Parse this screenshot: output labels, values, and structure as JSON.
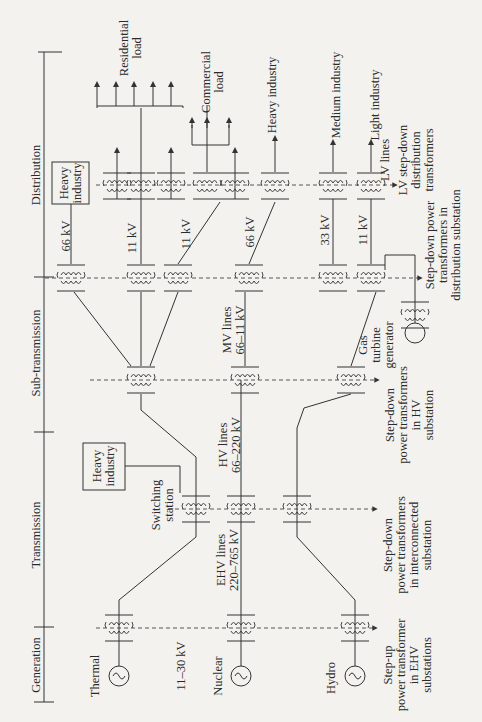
{
  "stages": [
    "Generation",
    "Transmission",
    "Sub-transmission",
    "Distribution"
  ],
  "generators": [
    {
      "name": "Thermal"
    },
    {
      "name": "Nuclear"
    },
    {
      "name": "Hydro"
    },
    {
      "name": "Gas turbine generator",
      "lines": [
        "Gas",
        "turbine",
        "generator"
      ]
    }
  ],
  "voltage_labels": {
    "generation": "11–30 kV",
    "ehv": [
      "EHV lines",
      "220–765 kV"
    ],
    "hv": [
      "HV lines",
      "66–220 kV"
    ],
    "mv": [
      "MV lines",
      "66–11 kV"
    ],
    "dist_66_top": "66 kV",
    "dist_11_a": "11 kV",
    "dist_11_b": "11 kV",
    "dist_66_mid": "66 kV",
    "dist_33": "33 kV",
    "dist_11_c": "11 kV",
    "lv": "LV lines"
  },
  "loads": {
    "heavy_industry_box_top": [
      "Heavy",
      "industry"
    ],
    "heavy_industry_box_switch": [
      "Heavy",
      "industry"
    ],
    "residential": [
      "Residential",
      "load"
    ],
    "commercial": [
      "Commercial",
      "load"
    ],
    "heavy_industry": "Heavy industry",
    "medium_industry": "Medium industry",
    "light_industry": "Light industry"
  },
  "switching_station": [
    "Switching",
    "station"
  ],
  "transformer_notes": {
    "step_up": [
      "Step-up",
      "power transformer",
      "in EHV",
      "substations"
    ],
    "interconnected": [
      "Step-down",
      "power transformers",
      "in interconnected",
      "substation"
    ],
    "hv_sub": [
      "Step-down",
      "power transformers",
      "in HV",
      "substation"
    ],
    "dist_sub": [
      "Step-down power",
      "transformers in",
      "distribution substation"
    ],
    "lv_dist": [
      "LV step-down",
      "distribution",
      "transformers"
    ]
  }
}
